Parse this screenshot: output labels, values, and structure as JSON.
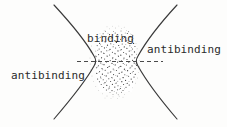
{
  "figure": {
    "name": "binding-and-antibinding-regions",
    "caption_labels": {
      "binding": "binding",
      "antibinding_right": "antibinding",
      "antibinding_left": "antibinding"
    },
    "colors": {
      "background": "#fdfdfc",
      "ink": "#2a2a2a",
      "curve": "#3a3a3a",
      "stipple": "#2b2b2b",
      "dashed_axis": "#4a4a4a"
    },
    "geometry": {
      "width": 227,
      "height": 127,
      "left_curve_vertex_x": 95,
      "right_curve_vertex_x": 137,
      "axis_y": 61,
      "dashed_axis_start_x": 77,
      "dashed_axis_end_x": 163,
      "curve_top_y": 5,
      "curve_bottom_y": 119
    }
  }
}
